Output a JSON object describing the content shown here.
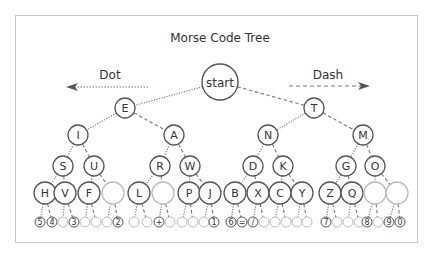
{
  "title": "Morse Code Tree",
  "legend": {
    "dot_label": "Dot",
    "dash_label": "Dash"
  },
  "colors": {
    "node_stroke": "#555555",
    "empty_stroke": "#bbbbbb",
    "line": "#777777",
    "text": "#333333",
    "frame": "#c8c8c8"
  },
  "root": {
    "label": "start",
    "x": 220,
    "y": 82,
    "r": 18
  },
  "nodes": [
    {
      "id": "E",
      "label": "E",
      "x": 125,
      "y": 108,
      "r": 10,
      "parent": "root",
      "edge": "dot"
    },
    {
      "id": "T",
      "label": "T",
      "x": 314,
      "y": 108,
      "r": 10,
      "parent": "root",
      "edge": "dash"
    },
    {
      "id": "I",
      "label": "I",
      "x": 78,
      "y": 135,
      "r": 10,
      "parent": "E",
      "edge": "dot"
    },
    {
      "id": "A",
      "label": "A",
      "x": 174,
      "y": 135,
      "r": 10,
      "parent": "E",
      "edge": "dash"
    },
    {
      "id": "N",
      "label": "N",
      "x": 268,
      "y": 135,
      "r": 10,
      "parent": "T",
      "edge": "dot"
    },
    {
      "id": "M",
      "label": "M",
      "x": 363,
      "y": 135,
      "r": 10,
      "parent": "T",
      "edge": "dash"
    },
    {
      "id": "S",
      "label": "S",
      "x": 63,
      "y": 166,
      "r": 10,
      "parent": "I",
      "edge": "dot"
    },
    {
      "id": "U",
      "label": "U",
      "x": 94,
      "y": 166,
      "r": 10,
      "parent": "I",
      "edge": "dash"
    },
    {
      "id": "R",
      "label": "R",
      "x": 160,
      "y": 166,
      "r": 10,
      "parent": "A",
      "edge": "dot"
    },
    {
      "id": "W",
      "label": "W",
      "x": 190,
      "y": 166,
      "r": 10,
      "parent": "A",
      "edge": "dash"
    },
    {
      "id": "D",
      "label": "D",
      "x": 253,
      "y": 166,
      "r": 10,
      "parent": "N",
      "edge": "dot"
    },
    {
      "id": "K",
      "label": "K",
      "x": 283,
      "y": 166,
      "r": 10,
      "parent": "N",
      "edge": "dash"
    },
    {
      "id": "G",
      "label": "G",
      "x": 346,
      "y": 166,
      "r": 10,
      "parent": "M",
      "edge": "dot"
    },
    {
      "id": "O",
      "label": "O",
      "x": 375,
      "y": 166,
      "r": 10,
      "parent": "M",
      "edge": "dash"
    },
    {
      "id": "H",
      "label": "H",
      "x": 45,
      "y": 193,
      "r": 11,
      "parent": "S",
      "edge": "dot"
    },
    {
      "id": "V",
      "label": "V",
      "x": 65,
      "y": 193,
      "r": 11,
      "parent": "S",
      "edge": "dash"
    },
    {
      "id": "F",
      "label": "F",
      "x": 89,
      "y": 193,
      "r": 11,
      "parent": "U",
      "edge": "dot"
    },
    {
      "id": "U2",
      "label": "",
      "x": 113,
      "y": 193,
      "r": 11,
      "parent": "U",
      "edge": "dash"
    },
    {
      "id": "L",
      "label": "L",
      "x": 139,
      "y": 193,
      "r": 11,
      "parent": "R",
      "edge": "dot"
    },
    {
      "id": "R2",
      "label": "",
      "x": 163,
      "y": 193,
      "r": 11,
      "parent": "R",
      "edge": "dash"
    },
    {
      "id": "P",
      "label": "P",
      "x": 189,
      "y": 193,
      "r": 11,
      "parent": "W",
      "edge": "dot"
    },
    {
      "id": "J",
      "label": "J",
      "x": 210,
      "y": 193,
      "r": 11,
      "parent": "W",
      "edge": "dash"
    },
    {
      "id": "B",
      "label": "B",
      "x": 235,
      "y": 193,
      "r": 11,
      "parent": "D",
      "edge": "dot"
    },
    {
      "id": "X",
      "label": "X",
      "x": 258,
      "y": 193,
      "r": 11,
      "parent": "D",
      "edge": "dash"
    },
    {
      "id": "C",
      "label": "C",
      "x": 280,
      "y": 193,
      "r": 11,
      "parent": "K",
      "edge": "dot"
    },
    {
      "id": "Y",
      "label": "Y",
      "x": 302,
      "y": 193,
      "r": 11,
      "parent": "K",
      "edge": "dash"
    },
    {
      "id": "Z",
      "label": "Z",
      "x": 330,
      "y": 193,
      "r": 11,
      "parent": "G",
      "edge": "dot"
    },
    {
      "id": "Q",
      "label": "Q",
      "x": 352,
      "y": 193,
      "r": 11,
      "parent": "G",
      "edge": "dash"
    },
    {
      "id": "O1",
      "label": "",
      "x": 375,
      "y": 193,
      "r": 11,
      "parent": "O",
      "edge": "dot"
    },
    {
      "id": "O2",
      "label": "",
      "x": 397,
      "y": 193,
      "r": 11,
      "parent": "O",
      "edge": "dash"
    }
  ],
  "leaves": [
    {
      "label": "5",
      "x": 40,
      "parent": "H",
      "edge": "dot"
    },
    {
      "label": "4",
      "x": 52,
      "parent": "H",
      "edge": "dash"
    },
    {
      "label": "",
      "x": 63,
      "parent": "V",
      "edge": "dot"
    },
    {
      "label": "3",
      "x": 74,
      "parent": "V",
      "edge": "dash"
    },
    {
      "label": "",
      "x": 85,
      "parent": "F",
      "edge": "dot"
    },
    {
      "label": "",
      "x": 96,
      "parent": "F",
      "edge": "dash"
    },
    {
      "label": "",
      "x": 107,
      "parent": "U2",
      "edge": "dot"
    },
    {
      "label": "2",
      "x": 118,
      "parent": "U2",
      "edge": "dash"
    },
    {
      "label": "",
      "x": 134,
      "parent": "L",
      "edge": "dot"
    },
    {
      "label": "",
      "x": 147,
      "parent": "L",
      "edge": "dash"
    },
    {
      "label": "+",
      "x": 159,
      "parent": "R2",
      "edge": "dot"
    },
    {
      "label": "",
      "x": 170,
      "parent": "R2",
      "edge": "dash"
    },
    {
      "label": "",
      "x": 182,
      "parent": "P",
      "edge": "dot"
    },
    {
      "label": "",
      "x": 193,
      "parent": "P",
      "edge": "dash"
    },
    {
      "label": "",
      "x": 204,
      "parent": "J",
      "edge": "dot"
    },
    {
      "label": "1",
      "x": 214,
      "parent": "J",
      "edge": "dash"
    },
    {
      "label": "6",
      "x": 231,
      "parent": "B",
      "edge": "dot"
    },
    {
      "label": "=",
      "x": 242,
      "parent": "B",
      "edge": "dash"
    },
    {
      "label": "/",
      "x": 253,
      "parent": "X",
      "edge": "dot"
    },
    {
      "label": "",
      "x": 264,
      "parent": "X",
      "edge": "dash"
    },
    {
      "label": "",
      "x": 275,
      "parent": "C",
      "edge": "dot"
    },
    {
      "label": "",
      "x": 286,
      "parent": "C",
      "edge": "dash"
    },
    {
      "label": "",
      "x": 297,
      "parent": "Y",
      "edge": "dot"
    },
    {
      "label": "",
      "x": 307,
      "parent": "Y",
      "edge": "dash"
    },
    {
      "label": "7",
      "x": 326,
      "parent": "Z",
      "edge": "dot"
    },
    {
      "label": "",
      "x": 337,
      "parent": "Z",
      "edge": "dash"
    },
    {
      "label": "",
      "x": 348,
      "parent": "Q",
      "edge": "dot"
    },
    {
      "label": "",
      "x": 359,
      "parent": "Q",
      "edge": "dash"
    },
    {
      "label": "8",
      "x": 367,
      "parent": "O1",
      "edge": "dot"
    },
    {
      "label": "",
      "x": 378,
      "parent": "O1",
      "edge": "dash"
    },
    {
      "label": "9",
      "x": 389,
      "parent": "O2",
      "edge": "dot"
    },
    {
      "label": "0",
      "x": 400,
      "parent": "O2",
      "edge": "dash"
    }
  ],
  "leaf_y": 222,
  "leaf_r": 5
}
